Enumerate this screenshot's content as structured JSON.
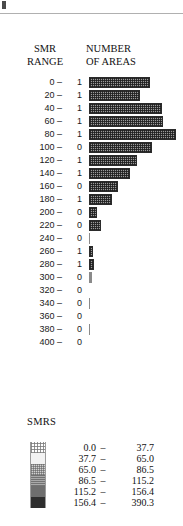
{
  "figure": {
    "corner_mark": "page-corner-mark",
    "rule": "horizontal-rule"
  },
  "headers": {
    "left_line1": "SMR",
    "left_line2": "RANGE",
    "right_line1": "NUMBER",
    "right_line2": "OF AREAS"
  },
  "legend": {
    "title": "SMRS",
    "classes": [
      {
        "from": "0.0",
        "dash": "–",
        "to": "37.7"
      },
      {
        "from": "37.7",
        "dash": "–",
        "to": "65.0"
      },
      {
        "from": "65.0",
        "dash": "–",
        "to": "86.5"
      },
      {
        "from": "86.5",
        "dash": "–",
        "to": "115.2"
      },
      {
        "from": "115.2",
        "dash": "–",
        "to": "156.4"
      },
      {
        "from": "156.4",
        "dash": "–",
        "to": "390.3"
      }
    ]
  },
  "chart_data": {
    "type": "bar",
    "title": "NUMBER OF AREAS",
    "xlabel": "NUMBER OF AREAS",
    "ylabel": "SMR RANGE",
    "orientation": "horizontal",
    "grid": false,
    "legend_position": "bottom-left",
    "categories": [
      "0 –",
      "20 –",
      "40 –",
      "60 –",
      "80 –",
      "100 –",
      "120 –",
      "140 –",
      "160 –",
      "180 –",
      "200 –",
      "220 –",
      "240 –",
      "260 –",
      "280 –",
      "300 –",
      "320 –",
      "340 –",
      "360 –",
      "380 –",
      "400 –"
    ],
    "count_labels": [
      "1",
      "1",
      "1",
      "1",
      "1",
      "0",
      "1",
      "1",
      "0",
      "1",
      "0",
      "0",
      "0",
      "1",
      "1",
      "0",
      "0",
      "0",
      "0",
      "0",
      "0"
    ],
    "values": [
      61,
      51,
      73,
      74,
      87,
      63,
      48,
      41,
      29,
      23,
      8,
      12,
      1,
      4,
      5,
      3,
      0,
      1,
      0,
      1,
      0
    ],
    "xlim": [
      0,
      94
    ],
    "bar_fill": "#9a9a9a",
    "bar_border": "#2b2b2b"
  }
}
